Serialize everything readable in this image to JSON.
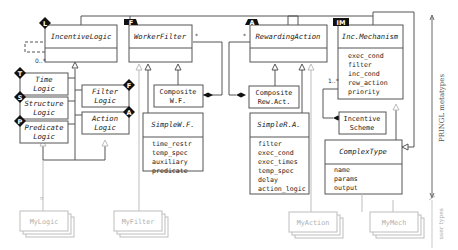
{
  "diagram": {
    "type": "UML class diagram",
    "side_labels": {
      "metatypes": "PRINGL metatypes",
      "user_types": "user types"
    },
    "classes": {
      "incentive_logic": {
        "badge": "L",
        "title": "IncentiveLogic",
        "multiplicity": "0..*"
      },
      "worker_filter": {
        "badge": "F",
        "title": "WorkerFilter",
        "multiplicity": "*"
      },
      "rewarding_action": {
        "badge": "A",
        "title": "RewardingAction",
        "multiplicity": "*"
      },
      "inc_mechanism": {
        "badge": "IM",
        "title": "Inc.Mechanism",
        "attributes": [
          "exec_cond",
          "filter",
          "inc_cond",
          "rew_action",
          "priority"
        ],
        "multiplicity": "1..*"
      },
      "time_logic": {
        "badge": "T",
        "title_lines": [
          "Time",
          "Logic"
        ]
      },
      "structure_logic": {
        "badge": "S",
        "title_lines": [
          "Structure",
          "Logic"
        ]
      },
      "predicate_logic": {
        "badge": "P",
        "title_lines": [
          "Predicate",
          "Logic"
        ]
      },
      "filter_logic": {
        "badge": "F",
        "title_lines": [
          "Filter",
          "Logic"
        ]
      },
      "action_logic": {
        "badge": "A",
        "title_lines": [
          "Action",
          "Logic"
        ]
      },
      "composite_wf": {
        "title_lines": [
          "Composite",
          "W.F."
        ]
      },
      "simple_wf": {
        "title": "SimpleW.F.",
        "attributes": [
          "time_restr",
          "temp_spec",
          "auxiliary",
          "predicate"
        ]
      },
      "composite_ra": {
        "title_lines": [
          "Composite",
          "Rew.Act."
        ]
      },
      "simple_ra": {
        "title": "SimpleR.A.",
        "attributes": [
          "filter",
          "exec_cond",
          "exec_times",
          "temp_spec",
          "delay",
          "action_logic"
        ]
      },
      "incentive_scheme": {
        "title_lines": [
          "Incentive",
          "Scheme"
        ]
      },
      "complex_type": {
        "title": "ComplexType",
        "attributes": [
          "name",
          "params",
          "output"
        ]
      }
    },
    "user_types": {
      "my_logic": "MyLogic",
      "my_filter": "MyFilter",
      "my_action": "MyAction",
      "my_mech": "MyMech"
    }
  }
}
